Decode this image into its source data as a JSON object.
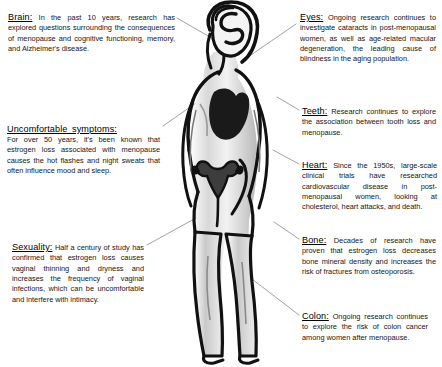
{
  "document": {
    "type": "anatomical-infographic",
    "subject": "Menopause research effects on the female body",
    "background_color": "#ffffff",
    "text_color": "#161616",
    "leader_line_color": "#8a8a8a",
    "figure_ink_color": "#111111"
  },
  "callouts": [
    {
      "id": "brain",
      "heading": "Brain:",
      "body": " In the past 10 years, research has explored questions surrounding the consequences of menopause and cognitive functioning, memory, and Alzheimer's disease.",
      "side": "left"
    },
    {
      "id": "symptoms",
      "heading": "Uncomfortable symptoms:",
      "body": "For over 50 years, it's been known that estrogen loss associated with menopause causes the hot flashes and night sweats that often influence mood and sleep.",
      "side": "left",
      "heading_on_own_line": true
    },
    {
      "id": "sexuality",
      "heading": "Sexuality:",
      "body": " Half a century of study has confirmed that estrogen loss causes vaginal thinning and dryness and increases the frequency of vaginal infections, which can be uncomfortable and interfere with intimacy.",
      "side": "left"
    },
    {
      "id": "eyes",
      "heading": "Eyes:",
      "body": " Ongoing research continues to investigate cataracts in post-menopausal women, as well as age-related macular degeneration, the leading cause of blindness in the aging population.",
      "side": "right"
    },
    {
      "id": "teeth",
      "heading": "Teeth:",
      "body": " Research continues to explore the association between tooth loss and menopause.",
      "side": "right"
    },
    {
      "id": "heart",
      "heading": "Heart:",
      "body": " Since the 1950s, large-scale clinical trials have researched cardiovascular disease in post-menopausal women, looking at cholesterol, heart attacks, and death.",
      "side": "right"
    },
    {
      "id": "bone",
      "heading": "Bone:",
      "body": " Decades of research have proven that estrogen loss decreases bone mineral density and increases the risk of fractures from osteoporosis.",
      "side": "right"
    },
    {
      "id": "colon",
      "heading": "Colon:",
      "body": " Ongoing research continues to explore the risk of colon cancer among women after menopause.",
      "side": "right"
    }
  ]
}
